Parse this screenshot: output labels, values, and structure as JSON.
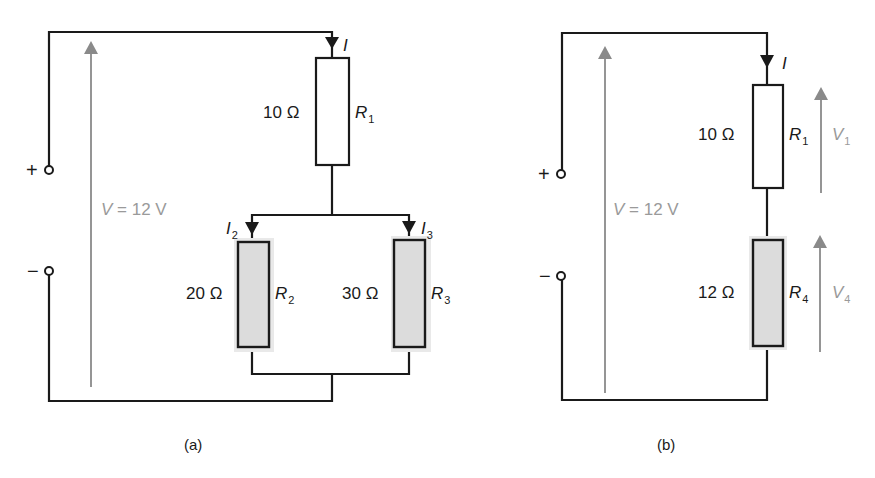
{
  "figure": {
    "panel_a": {
      "caption": "(a)",
      "source": {
        "plus": "+",
        "minus": "−",
        "voltage_symbol": "V",
        "voltage_eq": " = 12 V"
      },
      "current_total": "I",
      "r1": {
        "value": "10 Ω",
        "name": "R",
        "sub": "1"
      },
      "r2": {
        "value": "20 Ω",
        "name": "R",
        "sub": "2",
        "current": "I",
        "current_sub": "2"
      },
      "r3": {
        "value": "30 Ω",
        "name": "R",
        "sub": "3",
        "current": "I",
        "current_sub": "3"
      }
    },
    "panel_b": {
      "caption": "(b)",
      "source": {
        "plus": "+",
        "minus": "−",
        "voltage_symbol": "V",
        "voltage_eq": " = 12 V"
      },
      "current_total": "I",
      "r1": {
        "value": "10 Ω",
        "name": "R",
        "sub": "1",
        "voltage": "V",
        "voltage_sub": "1"
      },
      "r4": {
        "value": "12 Ω",
        "name": "R",
        "sub": "4",
        "voltage": "V",
        "voltage_sub": "4"
      }
    },
    "colors": {
      "wire": "#1a1a1a",
      "voltage_arrow": "#8a8a8a",
      "shaded_resistor": "#dcdcdc"
    }
  }
}
